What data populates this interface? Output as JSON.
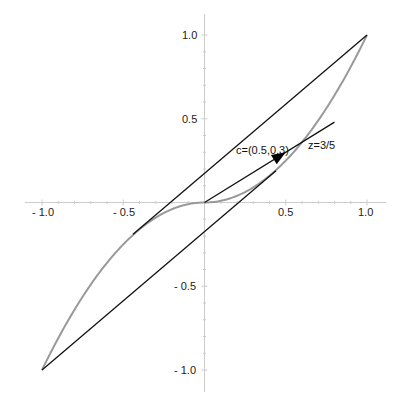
{
  "chart_data": {
    "type": "line",
    "title": "",
    "xlabel": "",
    "ylabel": "",
    "xlim": [
      -1.1,
      1.1
    ],
    "ylim": [
      -1.1,
      1.1
    ],
    "grid": false,
    "x_ticks": [
      -1.0,
      -0.5,
      0.5,
      1.0
    ],
    "y_ticks": [
      -1.0,
      -0.5,
      0.5,
      1.0
    ],
    "x_tick_labels": [
      "- 1.0",
      "- 0.5",
      "0.5",
      "1.0"
    ],
    "y_tick_labels": [
      "1.0",
      "0.5",
      "- 0.5",
      "- 1.0"
    ],
    "series": [
      {
        "name": "curve y = x|x|",
        "color": "#999999",
        "x": [
          -1.0,
          -0.8,
          -0.6,
          -0.44,
          -0.3,
          -0.2,
          -0.1,
          0.0,
          0.1,
          0.2,
          0.3,
          0.44,
          0.6,
          0.8,
          1.0
        ],
        "y": [
          -1.0,
          -0.64,
          -0.36,
          -0.19,
          -0.09,
          -0.04,
          -0.01,
          0.0,
          0.01,
          0.04,
          0.09,
          0.19,
          0.36,
          0.64,
          1.0
        ]
      },
      {
        "name": "upper tangent line",
        "color": "#111111",
        "x": [
          -0.44,
          1.0
        ],
        "y": [
          -0.19,
          1.0
        ]
      },
      {
        "name": "lower tangent line",
        "color": "#111111",
        "x": [
          -1.0,
          0.44
        ],
        "y": [
          -1.0,
          0.19
        ]
      },
      {
        "name": "ray z=3/5",
        "color": "#111111",
        "x": [
          0.0,
          0.8
        ],
        "y": [
          0.0,
          0.48
        ]
      }
    ],
    "arrow": {
      "from": [
        0.0,
        0.0
      ],
      "to": [
        0.5,
        0.3
      ],
      "color": "#000000"
    },
    "annotations": [
      {
        "text": "c=(0.5,0.3)",
        "x": 0.2,
        "y": 0.3
      },
      {
        "text": "z=3/5",
        "x": 0.63,
        "y": 0.33
      }
    ],
    "legend": null
  },
  "labels": {
    "c_label": "c=(0.5,0.3)",
    "z_label": "z=3/5",
    "x_tick_m1": "- 1.0",
    "x_tick_m05": "- 0.5",
    "x_tick_05": "0.5",
    "x_tick_1": "1.0",
    "y_tick_1": "1.0",
    "y_tick_05": "0.5",
    "y_tick_m05": "- 0.5",
    "y_tick_m1": "- 1.0"
  },
  "colors": {
    "axis": "#cccccc",
    "curve": "#999999",
    "line": "#111111"
  }
}
